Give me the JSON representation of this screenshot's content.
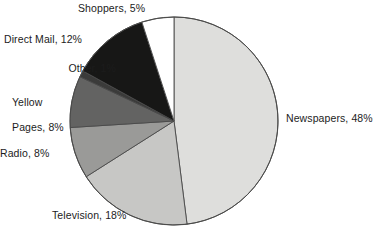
{
  "chart_data": {
    "type": "pie",
    "title": "",
    "subtitle": "",
    "xlabel": "",
    "ylabel": "",
    "legend_position": "none",
    "grid": false,
    "labels_show_percent": true,
    "start_angle_deg": 0,
    "direction": "clockwise",
    "categories": [
      "Newspapers",
      "Television",
      "Radio",
      "Yellow Pages",
      "Other",
      "Direct Mail",
      "Shoppers"
    ],
    "values": [
      48,
      18,
      8,
      8,
      1,
      12,
      5
    ],
    "units": "%",
    "slices": [
      {
        "name": "Newspapers",
        "value": 48,
        "label": "Newspapers, 48%",
        "color": "#dededc"
      },
      {
        "name": "Television",
        "value": 18,
        "label": "Television, 18%",
        "color": "#c7c7c5"
      },
      {
        "name": "Radio",
        "value": 8,
        "label": "Radio, 8%",
        "color": "#9a9a98"
      },
      {
        "name": "Yellow Pages",
        "value": 8,
        "label": "Pages, 8%",
        "label_line1": "Yellow",
        "color": "#636362"
      },
      {
        "name": "Other",
        "value": 1,
        "label": "Other, 1%",
        "color": "#3b3b3a"
      },
      {
        "name": "Direct Mail",
        "value": 12,
        "label": "Direct Mail, 12%",
        "color": "#171716"
      },
      {
        "name": "Shoppers",
        "value": 5,
        "label": "Shoppers, 5%",
        "color": "#ffffff"
      }
    ],
    "stroke_color": "#4a4a49",
    "background": "#ffffff"
  },
  "labels": {
    "newspapers": "Newspapers, 48%",
    "television": "Television, 18%",
    "radio": "Radio, 8%",
    "yellow_pages_line1": "Yellow",
    "yellow_pages_line2": "Pages, 8%",
    "other": "Other, 1%",
    "direct_mail": "Direct Mail, 12%",
    "shoppers": "Shoppers, 5%"
  }
}
